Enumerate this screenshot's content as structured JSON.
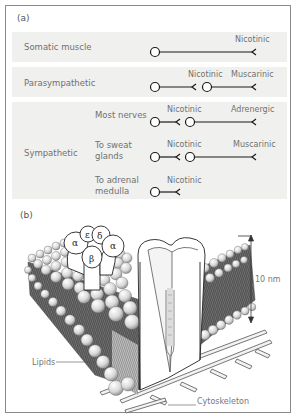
{
  "panel_a": {
    "label": "(a)",
    "rows": [
      {
        "name": "Somatic muscle",
        "receptors": [
          "Nicotinic"
        ]
      },
      {
        "name": "Parasympathetic",
        "receptors": [
          "Nicotinic",
          "Muscarinic"
        ]
      },
      {
        "name": "Sympathetic",
        "subrows": [
          {
            "name": "Most nerves",
            "receptors": [
              "Nicotinic",
              "Adrenergic"
            ]
          },
          {
            "name_line1": "To sweat",
            "name_line2": "glands",
            "receptors": [
              "Nicotinic",
              "Muscarinic"
            ]
          },
          {
            "name_line1": "To adrenal",
            "name_line2": "medulla",
            "receptors": [
              "Nicotinic"
            ]
          }
        ]
      }
    ]
  },
  "panel_b": {
    "label": "(b)",
    "subunits": [
      "α",
      "ε",
      "δ",
      "β",
      "α"
    ],
    "scale_label": "10 nm",
    "callouts": {
      "lipids": "Lipids",
      "cytoskeleton": "Cytoskeleton"
    }
  },
  "colors": {
    "band": "#f0f0ef",
    "line": "#1a1a1a",
    "text": "#707070",
    "frame": "#8a8a8a"
  }
}
